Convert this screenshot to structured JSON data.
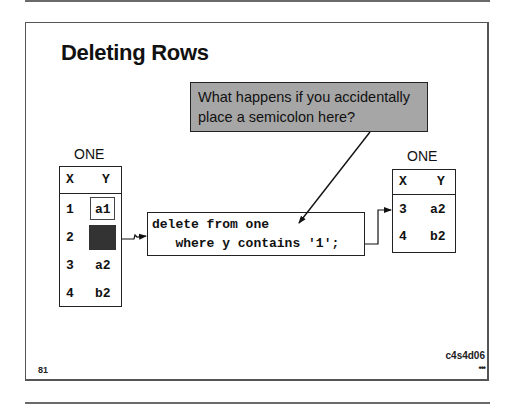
{
  "slide": {
    "title": "Deleting Rows",
    "callout": {
      "line1": "What happens if you accidentally",
      "line2": "place a semicolon here?",
      "fill_color": "#a6a6a6"
    },
    "left_table": {
      "label": "ONE",
      "columns": [
        "X",
        "Y"
      ],
      "rows": [
        {
          "x": "1",
          "y": "a1",
          "state": "highlighted"
        },
        {
          "x": "2",
          "y": "",
          "state": "deleted"
        },
        {
          "x": "3",
          "y": "a2",
          "state": "normal"
        },
        {
          "x": "4",
          "y": "b2",
          "state": "normal"
        }
      ]
    },
    "code": {
      "line1": "delete from one",
      "line2": "   where y contains '1';"
    },
    "right_table": {
      "label": "ONE",
      "columns": [
        "X",
        "Y"
      ],
      "rows": [
        {
          "x": "3",
          "y": "a2"
        },
        {
          "x": "4",
          "y": "b2"
        }
      ]
    },
    "page_number": "81",
    "slide_id": "c4s4d06",
    "more_indicator": "•••"
  }
}
